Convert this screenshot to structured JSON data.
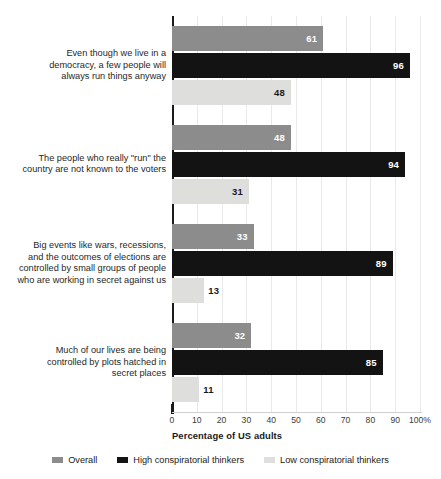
{
  "chart_data": {
    "type": "bar",
    "orientation": "horizontal",
    "title": "",
    "subtitle": "",
    "xlabel": "Percentage of US adults",
    "ylabel": "",
    "xlim": [
      0,
      100
    ],
    "xticks": [
      0,
      10,
      20,
      30,
      40,
      50,
      60,
      70,
      80,
      90,
      100
    ],
    "xtick_labels": [
      "0",
      "10",
      "20",
      "30",
      "40",
      "50",
      "60",
      "70",
      "80",
      "90",
      "100%"
    ],
    "grid": true,
    "grid_axis": "x",
    "legend_position": "bottom-center",
    "categories": [
      "Even though we live in a democracy, a few people will always run things anyway",
      "The people who really \"run\" the country are not known to the voters",
      "Big events like wars, recessions, and the outcomes of elections are controlled by small groups of people who are working in secret against us",
      "Much of our lives are being controlled by plots hatched in secret places"
    ],
    "category_lines": [
      [
        "Even though we live in a",
        "democracy, a few people will",
        "always run things anyway"
      ],
      [
        "The people who really \"run\" the",
        "country are not known to the voters"
      ],
      [
        "Big events like wars, recessions,",
        "and the outcomes of elections are",
        "controlled by small groups of people",
        "who are working in secret against us"
      ],
      [
        "Much of our lives are being",
        "controlled by plots hatched in",
        "secret places"
      ]
    ],
    "series": [
      {
        "name": "Overall",
        "color": "#8c8c8c",
        "values": [
          61,
          48,
          33,
          32
        ]
      },
      {
        "name": "High conspiratorial thinkers",
        "color": "#131313",
        "values": [
          96,
          94,
          89,
          85
        ]
      },
      {
        "name": "Low conspiratorial thinkers",
        "color": "#dededc",
        "values": [
          48,
          31,
          13,
          11
        ]
      }
    ]
  },
  "legend": {
    "items": [
      {
        "label": "Overall",
        "color": "#8c8c8c"
      },
      {
        "label": "High conspiratorial thinkers",
        "color": "#131313"
      },
      {
        "label": "Low conspiratorial thinkers",
        "color": "#dededc"
      }
    ]
  },
  "axis": {
    "x_title": "Percentage of US adults"
  }
}
